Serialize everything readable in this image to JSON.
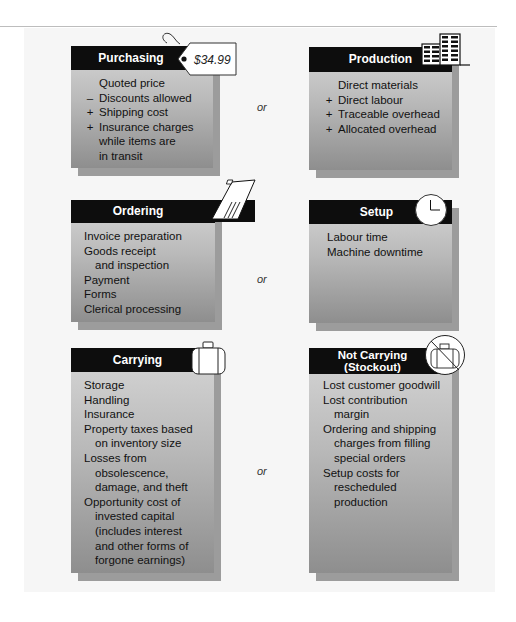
{
  "connector_label": "or",
  "cards": {
    "purchasing": {
      "title": "Purchasing",
      "icon": "price-tag-icon",
      "price_tag": "$34.99",
      "lines": [
        {
          "sign": "",
          "text": "Quoted price"
        },
        {
          "sign": "–",
          "text": "Discounts allowed"
        },
        {
          "sign": "+",
          "text": "Shipping cost"
        },
        {
          "sign": "+",
          "text": "Insurance charges"
        },
        {
          "sign": "",
          "text": "while items are"
        },
        {
          "sign": "",
          "text": "in transit"
        }
      ]
    },
    "production": {
      "title": "Production",
      "icon": "factory-building-icon",
      "lines": [
        {
          "sign": "",
          "text": "Direct materials"
        },
        {
          "sign": "+",
          "text": "Direct labour"
        },
        {
          "sign": "+",
          "text": "Traceable overhead"
        },
        {
          "sign": "+",
          "text": "Allocated overhead"
        }
      ]
    },
    "ordering": {
      "title": "Ordering",
      "icon": "invoice-form-icon",
      "lines": [
        "Invoice preparation",
        "Goods receipt",
        "and inspection",
        "Payment",
        "Forms",
        "Clerical processing"
      ]
    },
    "setup": {
      "title": "Setup",
      "icon": "clock-icon",
      "lines": [
        "Labour time",
        "Machine downtime"
      ]
    },
    "carrying": {
      "title": "Carrying",
      "icon": "suitcase-icon",
      "lines": [
        "Storage",
        "Handling",
        "Insurance",
        "Property taxes based",
        "on inventory size",
        "Losses from",
        "obsolescence,",
        "damage, and theft",
        "Opportunity cost of",
        "invested capital",
        "(includes interest",
        "and other forms of",
        "forgone earnings)"
      ]
    },
    "not_carrying": {
      "title_line1": "Not Carrying",
      "title_line2": "(Stockout)",
      "icon": "no-suitcase-icon",
      "lines": [
        "Lost customer goodwill",
        "Lost contribution",
        "margin",
        "Ordering and shipping",
        "charges from filling",
        "special orders",
        "Setup costs for",
        "rescheduled",
        "production"
      ]
    }
  }
}
